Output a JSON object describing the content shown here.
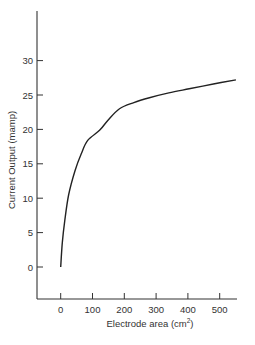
{
  "chart_data": {
    "type": "line",
    "title": "",
    "xlabel": "Electrode area (cm²)",
    "xlabel_main": "Electrode area (cm",
    "xlabel_sup": "2",
    "xlabel_end": ")",
    "ylabel": "Current Output (mamp)",
    "xlim": [
      -75,
      550
    ],
    "ylim": [
      -5,
      35
    ],
    "x_ticks": [
      0,
      100,
      200,
      300,
      400,
      500
    ],
    "y_ticks": [
      0,
      5,
      10,
      15,
      20,
      25,
      30
    ],
    "grid": false,
    "legend": null,
    "series": [
      {
        "name": "Current output",
        "x": [
          0,
          5,
          13,
          25,
          45,
          65,
          85,
          123,
          148,
          185,
          230,
          279,
          340,
          404,
          480,
          551
        ],
        "y": [
          0,
          3.5,
          6.8,
          10.5,
          14,
          16.5,
          18.4,
          19.9,
          21.3,
          23,
          23.9,
          24.6,
          25.3,
          25.9,
          26.6,
          27.2
        ]
      }
    ]
  },
  "colors": {
    "axis": "#333333",
    "line": "#222222",
    "background": "#ffffff"
  }
}
